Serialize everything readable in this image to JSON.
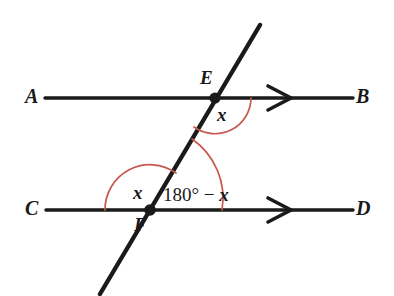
{
  "figure": {
    "background_color": "#ffffff",
    "line_color": "#1a1a1a",
    "arc_color": "#c8584e",
    "width": 394,
    "height": 296
  },
  "points": {
    "E": {
      "label": "E",
      "x": 215,
      "y": 98
    },
    "F": {
      "label": "F",
      "x": 150,
      "y": 210
    }
  },
  "endpoint_labels": {
    "A": "A",
    "B": "B",
    "C": "C",
    "D": "D"
  },
  "lines": [
    {
      "name": "line-ab",
      "from_label": "A",
      "to_label": "B",
      "x1": 45,
      "y1": 98,
      "x2": 353,
      "y2": 98,
      "arrow": true,
      "arrow_x": 290,
      "parallel_mark": 1
    },
    {
      "name": "line-cd",
      "from_label": "C",
      "to_label": "D",
      "x1": 46,
      "y1": 210,
      "x2": 353,
      "y2": 210,
      "arrow": true,
      "arrow_x": 290,
      "parallel_mark": 1
    },
    {
      "name": "transversal",
      "from_label": "",
      "to_label": "",
      "x1": 260,
      "y1": 25,
      "x2": 100,
      "y2": 294,
      "arrow": false
    }
  ],
  "angles": [
    {
      "name": "angle-at-e",
      "vertex": "E",
      "value_text": "x",
      "label_x": 223,
      "label_y": 113,
      "radius": 36,
      "between": "ray EB and ray EF"
    },
    {
      "name": "angle-at-f-left",
      "vertex": "F",
      "value_text": "x",
      "label_x": 138,
      "label_y": 190,
      "radius": 45,
      "between": "ray FC and ray FE"
    },
    {
      "name": "angle-at-f-right",
      "vertex": "F",
      "value_text": "180° − x",
      "label_x": 200,
      "label_y": 194,
      "radius": 72,
      "between": "ray FE and ray FD"
    }
  ],
  "angle_expression": {
    "degrees_part": "180°",
    "minus": " − ",
    "variable": "x"
  }
}
